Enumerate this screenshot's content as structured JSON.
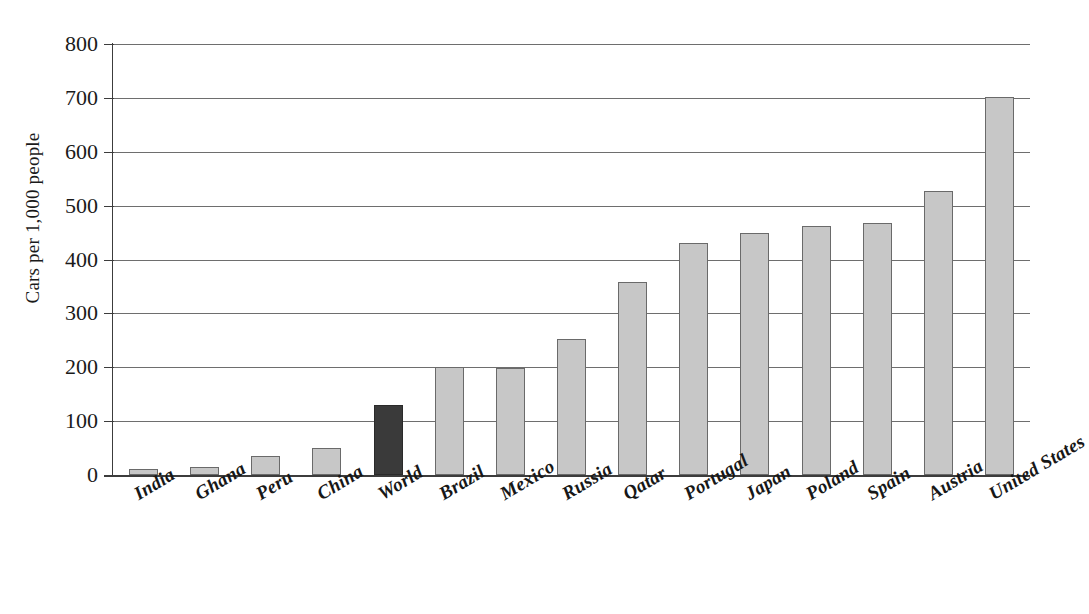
{
  "chart_data": {
    "type": "bar",
    "title": "",
    "subtitle": "",
    "xlabel": "",
    "ylabel": "Cars per 1,000 people",
    "ylim": [
      0,
      800
    ],
    "ytick_step": 100,
    "yticks": [
      800,
      700,
      600,
      500,
      400,
      300,
      200,
      100,
      0
    ],
    "ytick_labels": [
      "800",
      "700",
      "600",
      "500",
      "400",
      "300",
      "200",
      "100",
      "0"
    ],
    "grid": true,
    "grid_axis": "y",
    "legend": false,
    "legend_position": "none",
    "categories": [
      "India",
      "Ghana",
      "Peru",
      "China",
      "World",
      "Brazil",
      "Mexico",
      "Russia",
      "Qatar",
      "Portugal",
      "Japan",
      "Poland",
      "Spain",
      "Austria",
      "United States"
    ],
    "values": [
      12,
      14,
      35,
      50,
      130,
      200,
      199,
      253,
      358,
      430,
      450,
      462,
      468,
      527,
      702
    ],
    "highlight_category": "World",
    "bar_colors": {
      "default": "#c7c7c7",
      "highlight": "#3a3a3a",
      "border": "#6a6a6a"
    },
    "axis_color": "#3c3c3c",
    "gridline_color": "#6e6e6e",
    "background": "#ffffff",
    "annotations": []
  },
  "axis": {
    "y_title": "Cars per 1,000 people"
  }
}
